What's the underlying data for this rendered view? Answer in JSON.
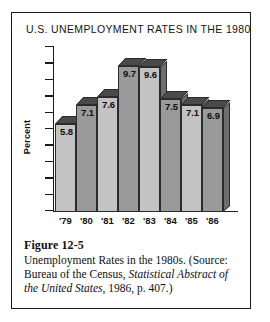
{
  "figure": {
    "number_label": "Figure 12-5",
    "description": "Unemployment Rates in the 1980s.",
    "source_prefix": "(Source: Bureau of the Census,",
    "source_italic": "Statistical Abstract of the United States",
    "source_suffix": ", 1986, p. 407.)"
  },
  "chart_data": {
    "type": "bar",
    "title": "U.S. UNEMPLOYMENT RATES IN THE 1980s",
    "xlabel": "",
    "ylabel": "Percent",
    "categories": [
      "'79",
      "'80",
      "'81",
      "'82",
      "'83",
      "'84",
      "'85",
      "'86"
    ],
    "values": [
      5.8,
      7.1,
      7.6,
      9.7,
      9.6,
      7.5,
      7.1,
      6.9
    ],
    "value_labels": [
      "5.8",
      "7.1",
      "7.6",
      "9.7",
      "9.6",
      "7.5",
      "7.1",
      "6.9"
    ],
    "ylim": [
      0,
      11
    ],
    "y_tick_count": 11,
    "y_tick_labels": [],
    "grid": false,
    "legend": null,
    "bar_shades": [
      "light",
      "dark",
      "light",
      "dark",
      "light",
      "dark",
      "light",
      "dark"
    ],
    "colors": {
      "bar_light": "#c3c3c3",
      "bar_dark": "#9a9a9a",
      "bar_top": "#4a4a4a",
      "bar_side": "#6e6e6e",
      "outline": "#2b2b2b",
      "axis": "#1a1a1a",
      "text": "#101010",
      "background": "#ffffff"
    }
  }
}
